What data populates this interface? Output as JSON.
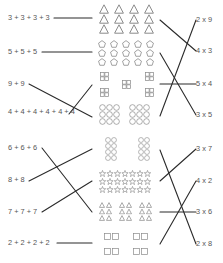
{
  "worksheet": {
    "title": "Match repeated addition, arrays and multiplication",
    "colors": {
      "line": "#2b2b2b",
      "shape_stroke": "#8a8a8a",
      "text": "#555555",
      "background": "#ffffff"
    },
    "sections": [
      {
        "left_expressions": [
          {
            "id": "a1",
            "text": "3 + 3 + 3 + 3",
            "y": 18
          },
          {
            "id": "a2",
            "text": "5 + 5 + 5",
            "y": 52
          },
          {
            "id": "a3",
            "text": "9 + 9",
            "y": 84
          },
          {
            "id": "a4",
            "text": "4 + 4 + 4 + 4 + 4 + 4",
            "y": 112
          }
        ],
        "arrays": [
          {
            "id": "g1",
            "shape": "triangle",
            "rows": 3,
            "cols": 4,
            "y": 18,
            "description": "3 rows of 4 triangles"
          },
          {
            "id": "g2",
            "shape": "pentagon",
            "rows": 3,
            "cols": 5,
            "y": 52,
            "description": "3 rows of 5 pentagons"
          },
          {
            "id": "g3",
            "shape": "square-cluster",
            "count": 5,
            "each": 4,
            "y": 84,
            "description": "5 groups of 4 squares"
          },
          {
            "id": "g4",
            "shape": "circle",
            "groups": 2,
            "rows": 3,
            "cols": 3,
            "y": 115,
            "description": "2 groups of 9 circles"
          }
        ],
        "right_products": [
          {
            "id": "p1",
            "text": "2 x 9",
            "y": 20
          },
          {
            "id": "p2",
            "text": "4 x 3",
            "y": 51
          },
          {
            "id": "p3",
            "text": "5 x 4",
            "y": 84
          },
          {
            "id": "p4",
            "text": "3 x 5",
            "y": 115
          }
        ],
        "left_connections": [
          {
            "from": "3 + 3 + 3 + 3",
            "to": "triangles"
          },
          {
            "from": "5 + 5 + 5",
            "to": "pentagons"
          },
          {
            "from": "9 + 9",
            "to": "circles"
          },
          {
            "from": "4 + 4 + 4 + 4 + 4 + 4",
            "to": "squares"
          }
        ],
        "right_connections": [
          {
            "from": "triangles",
            "to": "4 x 3"
          },
          {
            "from": "pentagons",
            "to": "3 x 5"
          },
          {
            "from": "squares",
            "to": "5 x 4"
          },
          {
            "from": "circles",
            "to": "2 x 9"
          }
        ]
      },
      {
        "left_expressions": [
          {
            "id": "b1",
            "text": "6 + 6 + 6",
            "y": 148
          },
          {
            "id": "b2",
            "text": "8 + 8",
            "y": 180
          },
          {
            "id": "b3",
            "text": "7 + 7 + 7",
            "y": 212
          },
          {
            "id": "b4",
            "text": "2 + 2 + 2 + 2",
            "y": 243
          }
        ],
        "arrays": [
          {
            "id": "h1",
            "shape": "circle",
            "groups": 2,
            "rows": 4,
            "cols": 2,
            "y": 149,
            "description": "2 groups of 8 circles"
          },
          {
            "id": "h2",
            "shape": "star",
            "rows": 3,
            "cols": 7,
            "y": 181,
            "description": "3 rows of 7 stars"
          },
          {
            "id": "h3",
            "shape": "triangle",
            "groups": 3,
            "rows": 3,
            "cols": 2,
            "y": 212,
            "description": "3 groups of 6 triangles"
          },
          {
            "id": "h4",
            "shape": "square",
            "groups": 4,
            "cols": 2,
            "y": 244,
            "description": "4 groups of 2 squares"
          }
        ],
        "right_products": [
          {
            "id": "q1",
            "text": "3 x 7",
            "y": 149
          },
          {
            "id": "q2",
            "text": "4 x 2",
            "y": 181
          },
          {
            "id": "q3",
            "text": "3 x 6",
            "y": 212
          },
          {
            "id": "q4",
            "text": "2 x 8",
            "y": 244
          }
        ],
        "left_connections": [
          {
            "from": "6 + 6 + 6",
            "to": "triangles"
          },
          {
            "from": "8 + 8",
            "to": "circles"
          },
          {
            "from": "7 + 7 + 7",
            "to": "stars"
          },
          {
            "from": "2 + 2 + 2 + 2",
            "to": "squares"
          }
        ],
        "right_connections": [
          {
            "from": "circles",
            "to": "2 x 8"
          },
          {
            "from": "stars",
            "to": "3 x 7"
          },
          {
            "from": "triangles",
            "to": "3 x 6"
          },
          {
            "from": "squares",
            "to": "4 x 2"
          }
        ]
      }
    ]
  }
}
